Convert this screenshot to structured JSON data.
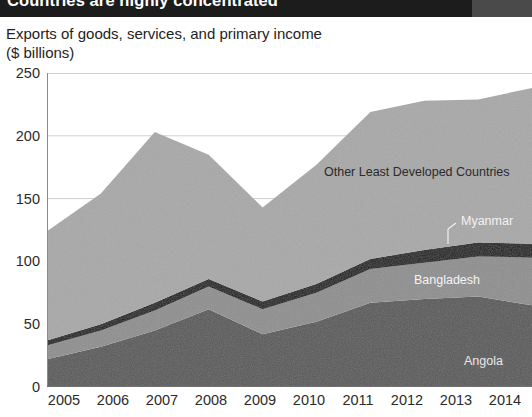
{
  "header": {
    "banner_title": "Countries are highly concentrated"
  },
  "chart_header": {
    "title": "Exports of goods, services, and primary income",
    "subtitle": "($ billions)"
  },
  "labels": {
    "other": "Other Least Developed Countries",
    "myanmar": "Myanmar",
    "bangladesh": "Bangladesh",
    "angola": "Angola"
  },
  "axis": {
    "y_ticks": [
      "250",
      "200",
      "150",
      "100",
      "50",
      "0"
    ],
    "x_ticks": [
      "2005",
      "2006",
      "2007",
      "2008",
      "2009",
      "2010",
      "2011",
      "2012",
      "2013",
      "2014"
    ]
  },
  "colors": {
    "banner": "#1c1c1c",
    "angola": "#585858",
    "bangladesh": "#8e8e8e",
    "myanmar": "#141414",
    "other": "#a8a8a8",
    "gridline": "#cfcfcf",
    "axis": "#6f6f6f"
  },
  "chart_data": {
    "type": "area",
    "title": "Exports of goods, services, and primary income",
    "subtitle": "($ billions)",
    "xlabel": "",
    "ylabel": "$ billions",
    "ylim": [
      0,
      250
    ],
    "y_gridlines": [
      0,
      50,
      100,
      150,
      200,
      250
    ],
    "grid": true,
    "stacked": true,
    "legend": "inline-annotations",
    "x": [
      2005,
      2006,
      2007,
      2008,
      2009,
      2010,
      2011,
      2012,
      2013,
      2014
    ],
    "series": [
      {
        "name": "Angola",
        "values": [
          22,
          32,
          45,
          62,
          42,
          52,
          67,
          70,
          72,
          65
        ]
      },
      {
        "name": "Bangladesh",
        "values": [
          11,
          13,
          16,
          18,
          20,
          23,
          27,
          29,
          32,
          38
        ]
      },
      {
        "name": "Myanmar",
        "values": [
          4,
          5,
          6,
          6,
          6,
          7,
          8,
          10,
          11,
          11
        ]
      },
      {
        "name": "Other Least Developed Countries",
        "values": [
          87,
          104,
          136,
          99,
          75,
          95,
          117,
          119,
          114,
          124
        ]
      }
    ],
    "totals": [
      124,
      154,
      203,
      185,
      143,
      177,
      219,
      228,
      229,
      238
    ]
  }
}
